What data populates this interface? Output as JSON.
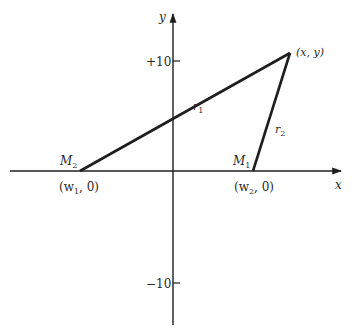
{
  "diagram": {
    "axes": {
      "x_label": "x",
      "y_label": "y",
      "y_tick_top": "+10",
      "y_tick_bottom": "−10"
    },
    "points": {
      "m2": {
        "name": "M",
        "sub": "2",
        "coord_pre": "(w",
        "coord_sub": "1",
        "coord_post": ", 0)"
      },
      "m1": {
        "name": "M",
        "sub": "1",
        "coord_pre": "(w",
        "coord_sub": "2",
        "coord_post": ", 0)"
      },
      "xy": {
        "label": "(x, y)"
      }
    },
    "segments": {
      "r1": {
        "name": "r",
        "sub": "1"
      },
      "r2": {
        "name": "r",
        "sub": "2"
      }
    },
    "colors": {
      "line": "#1e1e1e",
      "text": "#2a2a2a",
      "background": "#ffffff"
    }
  }
}
